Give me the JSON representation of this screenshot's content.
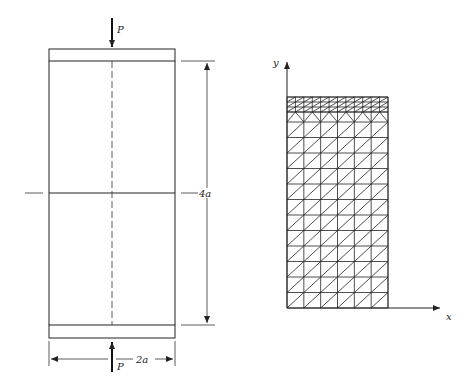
{
  "figure": {
    "left_panel": {
      "description": "Cylindrical specimen compressed between two rigid plates",
      "load_top_label": "P",
      "load_bottom_label": "P",
      "height_dimension_label": "4a",
      "width_dimension_label": "2a"
    },
    "right_panel": {
      "description": "Finite element mesh of one quadrant with triangular elements, refined near the top",
      "x_axis_label": "x",
      "y_axis_label": "y",
      "mesh": {
        "columns": 6,
        "coarse_rows": 12,
        "refined_top_rows": 3,
        "refined_top_columns": 12
      }
    },
    "colors": {
      "line": "#222222",
      "background": "#ffffff"
    }
  }
}
